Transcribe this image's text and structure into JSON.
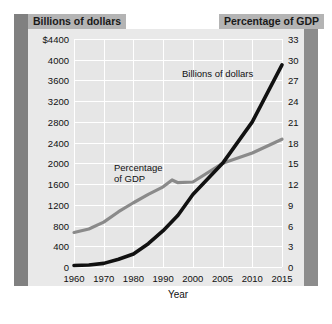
{
  "headers": {
    "left": "Billions of dollars",
    "right": "Percentage of GDP"
  },
  "chart_data": {
    "type": "line",
    "title": "",
    "xlabel": "Year",
    "categories": [
      "1960",
      "1970",
      "1980",
      "1990",
      "2000",
      "2005",
      "2010",
      "2015"
    ],
    "grid": true,
    "legend_position": "inline-annotation",
    "axes": {
      "left": {
        "label": "Billions of dollars",
        "ylim": [
          0,
          4400
        ],
        "ticks": [
          "$4400",
          "4000",
          "3600",
          "3200",
          "2800",
          "2400",
          "2000",
          "1600",
          "1200",
          "800",
          "400",
          "0"
        ],
        "tick_values": [
          4400,
          4000,
          3600,
          3200,
          2800,
          2400,
          2000,
          1600,
          1200,
          800,
          400,
          0
        ],
        "step": 400
      },
      "right": {
        "label": "Percentage of GDP",
        "ylim": [
          0,
          33
        ],
        "ticks": [
          "33",
          "30",
          "27",
          "24",
          "21",
          "18",
          "15",
          "12",
          "9",
          "6",
          "3",
          "0"
        ],
        "tick_values": [
          33,
          30,
          27,
          24,
          21,
          18,
          15,
          12,
          9,
          6,
          3,
          0
        ],
        "step": 3
      }
    },
    "series": [
      {
        "name": "Billions of dollars",
        "axis": "left",
        "color": "#111111",
        "x": [
          1960,
          1965,
          1970,
          1975,
          1980,
          1985,
          1990,
          1995,
          2000,
          2005,
          2010,
          2015
        ],
        "values": [
          30,
          40,
          70,
          150,
          250,
          450,
          700,
          1000,
          1400,
          2000,
          2800,
          3900
        ]
      },
      {
        "name": "Percentage of GDP",
        "axis": "right",
        "color": "#8a8a8a",
        "x": [
          1960,
          1965,
          1970,
          1975,
          1980,
          1985,
          1990,
          1993,
          1995,
          2000,
          2005,
          2010,
          2015
        ],
        "values": [
          5.0,
          5.5,
          6.5,
          8.0,
          9.3,
          10.5,
          11.6,
          12.6,
          12.2,
          12.3,
          15.0,
          16.5,
          18.5
        ]
      }
    ]
  },
  "annotations": {
    "billions": "Billions of dollars",
    "percentage_line1": "Percentage",
    "percentage_line2": "of GDP"
  }
}
